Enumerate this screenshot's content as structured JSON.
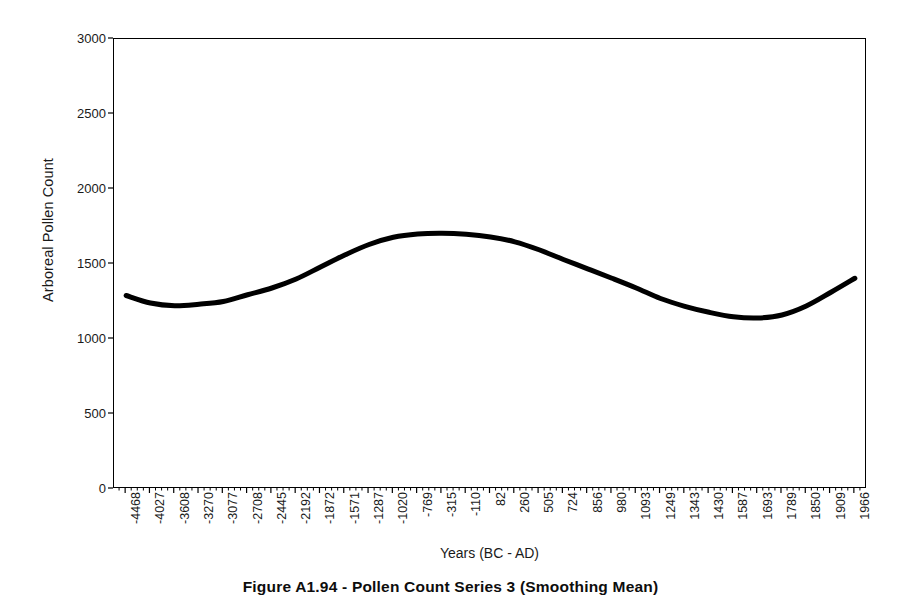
{
  "figure": {
    "caption": "Figure A1.94 - Pollen Count Series 3 (Smoothing Mean)"
  },
  "chart_data": {
    "type": "line",
    "title": "",
    "subtitle": "",
    "xlabel": "Years (BC - AD)",
    "ylabel": "Arboreal Pollen Count",
    "ylim": [
      0,
      3000
    ],
    "yticks": [
      0,
      500,
      1000,
      1500,
      2000,
      2500,
      3000
    ],
    "ytick_labels": [
      "0",
      "500",
      "1000",
      "1500",
      "2000",
      "2500",
      "3000"
    ],
    "grid": false,
    "legend": null,
    "legend_position": "none",
    "line_color": "#000000",
    "line_width": 5,
    "categories": [
      "-4468",
      "-4027",
      "-3608",
      "-3270",
      "-3077",
      "-2708",
      "-2445",
      "-2192",
      "-1872",
      "-1571",
      "-1287",
      "-1020",
      "-769",
      "-315",
      "-110",
      "82",
      "260",
      "505",
      "724",
      "856",
      "980",
      "1093",
      "1249",
      "1343",
      "1430",
      "1587",
      "1693",
      "1789",
      "1850",
      "1909",
      "1966"
    ],
    "series": [
      {
        "name": "Arboreal Pollen Count (smoothed)",
        "values": [
          1290,
          1240,
          1222,
          1232,
          1250,
          1295,
          1340,
          1400,
          1480,
          1560,
          1630,
          1678,
          1700,
          1705,
          1698,
          1680,
          1648,
          1595,
          1530,
          1468,
          1405,
          1340,
          1270,
          1218,
          1178,
          1148,
          1140,
          1160,
          1220,
          1310,
          1405
        ]
      }
    ]
  }
}
